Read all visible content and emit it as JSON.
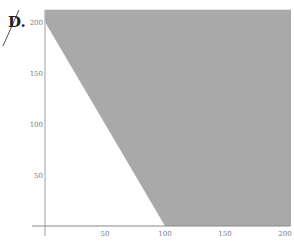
{
  "figure_label": "D.",
  "colors": {
    "shade": "#a9a9a9",
    "axis": "#b0b0b0",
    "boundary": "#555555",
    "tick_text": "#7a7a7a"
  },
  "chart_data": {
    "type": "area",
    "title": "",
    "xlabel": "",
    "ylabel": "",
    "xlim": [
      0,
      205
    ],
    "ylim": [
      0,
      212
    ],
    "x_ticks": [
      50,
      100,
      150,
      200
    ],
    "y_ticks": [
      50,
      100,
      150,
      200
    ],
    "grid": false,
    "boundary_line": {
      "points": [
        [
          0,
          200
        ],
        [
          100,
          0
        ]
      ],
      "equation": "2x + y = 200"
    },
    "shaded_region": {
      "description": "region above/right of line 2x + y = 200, within first quadrant",
      "polygon": [
        [
          0,
          212
        ],
        [
          0,
          200
        ],
        [
          100,
          0
        ],
        [
          205,
          0
        ],
        [
          205,
          212
        ]
      ]
    }
  }
}
